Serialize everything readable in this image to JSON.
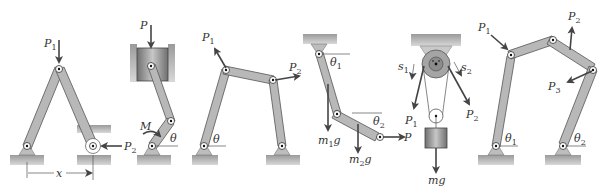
{
  "figure": {
    "panels": [
      {
        "id": "a",
        "labels": {
          "force1": "P",
          "force1_sub": "1",
          "force2": "P",
          "force2_sub": "2",
          "dimension": "x"
        }
      },
      {
        "id": "b",
        "labels": {
          "force": "P",
          "moment": "M",
          "angle": "θ"
        }
      },
      {
        "id": "c",
        "labels": {
          "force1": "P",
          "force1_sub": "1",
          "force2": "P",
          "force2_sub": "2",
          "angle": "θ"
        }
      },
      {
        "id": "d",
        "labels": {
          "angle1": "θ",
          "angle1_sub": "1",
          "angle2": "θ",
          "angle2_sub": "2",
          "weight1": "m",
          "weight1_sub": "1",
          "weight1_suffix": "g",
          "weight2": "m",
          "weight2_sub": "2",
          "weight2_suffix": "g",
          "force": "P"
        }
      },
      {
        "id": "e",
        "labels": {
          "disp1": "s",
          "disp1_sub": "1",
          "disp2": "s",
          "disp2_sub": "2",
          "force1": "P",
          "force1_sub": "1",
          "force2": "P",
          "force2_sub": "2",
          "weight": "mg"
        }
      },
      {
        "id": "f",
        "labels": {
          "force1": "P",
          "force1_sub": "1",
          "force2": "P",
          "force2_sub": "2",
          "force3": "P",
          "force3_sub": "3",
          "angle1": "θ",
          "angle1_sub": "1",
          "angle2": "θ",
          "angle2_sub": "2"
        }
      }
    ]
  }
}
